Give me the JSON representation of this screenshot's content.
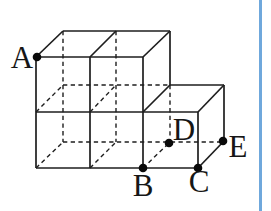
{
  "page": {
    "background": "#ffffff",
    "rule_color": "#6fa8dc"
  },
  "diagram": {
    "stroke_color": "#1e1e1e",
    "dot_color": "#0a0a0a",
    "label_color": "#161616",
    "dot_radius": 4.3,
    "solid_stroke_width": 1.7,
    "hidden_stroke_width": 1.4,
    "dash_pattern": "4.3 3.4",
    "label_font_size": 31,
    "solid_edges": [
      [
        36,
        57,
        143,
        57
      ],
      [
        36,
        57,
        36,
        168
      ],
      [
        36,
        168,
        198,
        168
      ],
      [
        143,
        57,
        143,
        168
      ],
      [
        90,
        57,
        90,
        168
      ],
      [
        36,
        112,
        198,
        112
      ],
      [
        36,
        57,
        63,
        31
      ],
      [
        90,
        57,
        116,
        31
      ],
      [
        143,
        57,
        170,
        31
      ],
      [
        63,
        31,
        170,
        31
      ],
      [
        170,
        31,
        170,
        85
      ],
      [
        143,
        112,
        170,
        85
      ],
      [
        170,
        85,
        224,
        85
      ],
      [
        198,
        112,
        224,
        85
      ],
      [
        198,
        112,
        198,
        168
      ],
      [
        224,
        85,
        224,
        141
      ],
      [
        198,
        168,
        224,
        141
      ]
    ],
    "hidden_edges": [
      [
        63,
        31,
        63,
        142
      ],
      [
        116,
        31,
        116,
        142
      ],
      [
        63,
        85,
        170,
        85
      ],
      [
        63,
        142,
        223,
        142
      ],
      [
        36,
        112,
        63,
        85
      ],
      [
        90,
        112,
        116,
        85
      ],
      [
        36,
        168,
        63,
        142
      ],
      [
        90,
        168,
        116,
        142
      ],
      [
        143,
        168,
        169,
        143
      ],
      [
        170,
        85,
        170,
        142
      ]
    ],
    "points": [
      {
        "label": "A",
        "x": 37,
        "y": 57,
        "lx": 22,
        "ly": 68
      },
      {
        "label": "B",
        "x": 143,
        "y": 168,
        "lx": 143,
        "ly": 196
      },
      {
        "label": "C",
        "x": 198,
        "y": 168,
        "lx": 199,
        "ly": 192
      },
      {
        "label": "D",
        "x": 169,
        "y": 143,
        "lx": 184,
        "ly": 140
      },
      {
        "label": "E",
        "x": 223,
        "y": 141,
        "lx": 238,
        "ly": 157
      }
    ]
  }
}
